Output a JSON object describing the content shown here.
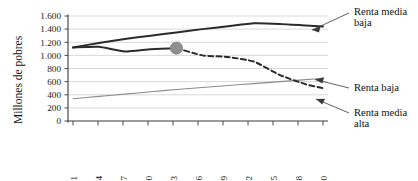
{
  "chart_data": {
    "type": "line",
    "title": "",
    "xlabel": "",
    "ylabel": "Millones de pobres",
    "x": [
      1981,
      1984,
      1987,
      1990,
      1993,
      1996,
      1999,
      2002,
      2005,
      2008,
      2010
    ],
    "categories": [
      "1981",
      "1984",
      "1987",
      "1990",
      "1993",
      "1996",
      "1999",
      "2002",
      "2005",
      "2008",
      "2010"
    ],
    "ylim": [
      0,
      1600
    ],
    "ytick_values": [
      0,
      200,
      400,
      600,
      800,
      1000,
      1200,
      1400,
      1600
    ],
    "ytick_labels": [
      "0",
      "200",
      "400",
      "600",
      "800",
      "1.000",
      "1.200",
      "1.400",
      "1.600"
    ],
    "grid": true,
    "legend_position": "annotations-right",
    "series": [
      {
        "name": "Renta media baja",
        "style": "solid-thick",
        "color": "#2b2b2b",
        "values": [
          1120,
          1190,
          1250,
          1300,
          1350,
          1400,
          1445,
          1490,
          1480,
          1455,
          1440
        ]
      },
      {
        "name": "Renta media alta",
        "style": "solid-then-dashed",
        "color": "#2b2b2b",
        "dash_from": 1993,
        "values": [
          1120,
          1130,
          1060,
          1095,
          1110,
          1000,
          975,
          905,
          700,
          560,
          500
        ]
      },
      {
        "name": "Renta baja",
        "style": "solid-thin",
        "color": "#8c8c8c",
        "values": [
          340,
          375,
          410,
          445,
          480,
          510,
          540,
          570,
          600,
          630,
          650
        ]
      }
    ],
    "markers": [
      {
        "name": "transition-marker",
        "series": "Renta media alta",
        "x": 1993,
        "y": 1110
      }
    ],
    "annotations": [
      {
        "name": "annotation-renta-media-baja",
        "text_line1": "Renta media",
        "text_line2": "baja"
      },
      {
        "name": "annotation-renta-baja",
        "text_line1": "Renta baja",
        "text_line2": ""
      },
      {
        "name": "annotation-renta-media-alta",
        "text_line1": "Renta media",
        "text_line2": "alta"
      }
    ]
  }
}
